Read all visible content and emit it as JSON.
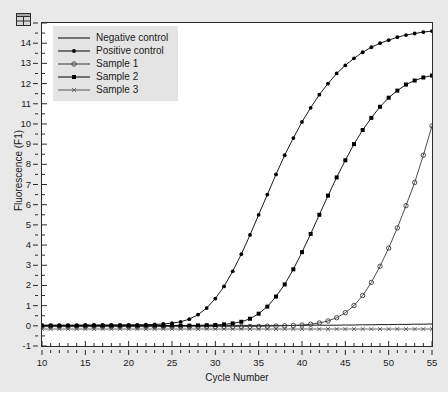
{
  "window": {
    "icon_name": "window-grid-icon"
  },
  "chart_data": {
    "type": "line",
    "title": "",
    "xlabel": "Cycle Number",
    "ylabel": "Fluorescence (F1)",
    "xlim": [
      10,
      55
    ],
    "ylim": [
      -1,
      15
    ],
    "x_major_step": 5,
    "x_minor_step": 1,
    "y_major_step": 1,
    "y_minor_step": 0.5,
    "grid": false,
    "legend_position": "top-left",
    "x_tick_labels": [
      "10",
      "15",
      "20",
      "25",
      "30",
      "35",
      "40",
      "45",
      "50",
      "55"
    ],
    "y_tick_labels": [
      "-1",
      "0",
      "1",
      "2",
      "3",
      "4",
      "5",
      "6",
      "7",
      "8",
      "9",
      "10",
      "11",
      "12",
      "13",
      "14",
      "15"
    ],
    "x": [
      10,
      11,
      12,
      13,
      14,
      15,
      16,
      17,
      18,
      19,
      20,
      21,
      22,
      23,
      24,
      25,
      26,
      27,
      28,
      29,
      30,
      31,
      32,
      33,
      34,
      35,
      36,
      37,
      38,
      39,
      40,
      41,
      42,
      43,
      44,
      45,
      46,
      47,
      48,
      49,
      50,
      51,
      52,
      53,
      54,
      55
    ],
    "series": [
      {
        "name": "Negative control",
        "marker": "none",
        "color": "#000000",
        "values": [
          0.02,
          0.02,
          0.02,
          0.02,
          0.02,
          0.02,
          0.02,
          0.02,
          0.02,
          0.02,
          0.02,
          0.02,
          0.02,
          0.02,
          0.02,
          0.02,
          0.02,
          0.02,
          0.02,
          0.02,
          0.02,
          0.02,
          0.02,
          0.02,
          0.02,
          0.02,
          0.02,
          0.02,
          0.02,
          0.02,
          0.02,
          0.03,
          0.03,
          0.03,
          0.03,
          0.04,
          0.04,
          0.05,
          0.05,
          0.06,
          0.06,
          0.07,
          0.07,
          0.08,
          0.08,
          0.09
        ]
      },
      {
        "name": "Positive control",
        "marker": "dot",
        "color": "#000000",
        "values": [
          0.03,
          0.03,
          0.03,
          0.03,
          0.03,
          0.04,
          0.04,
          0.04,
          0.04,
          0.05,
          0.05,
          0.05,
          0.06,
          0.07,
          0.09,
          0.13,
          0.2,
          0.33,
          0.55,
          0.88,
          1.35,
          1.95,
          2.7,
          3.55,
          4.5,
          5.5,
          6.5,
          7.5,
          8.45,
          9.3,
          10.1,
          10.8,
          11.45,
          12.0,
          12.5,
          12.9,
          13.25,
          13.55,
          13.8,
          14.0,
          14.15,
          14.3,
          14.4,
          14.48,
          14.55,
          14.6
        ]
      },
      {
        "name": "Sample 1",
        "marker": "circle",
        "color": "#3a3a3a",
        "values": [
          -0.04,
          -0.04,
          -0.04,
          -0.04,
          -0.04,
          -0.04,
          -0.04,
          -0.04,
          -0.04,
          -0.04,
          -0.04,
          -0.04,
          -0.04,
          -0.04,
          -0.04,
          -0.04,
          -0.04,
          -0.04,
          -0.04,
          -0.04,
          -0.04,
          -0.04,
          -0.04,
          -0.04,
          -0.03,
          -0.03,
          -0.02,
          -0.01,
          0.0,
          0.02,
          0.04,
          0.08,
          0.14,
          0.24,
          0.4,
          0.65,
          1.0,
          1.5,
          2.15,
          2.95,
          3.85,
          4.85,
          5.95,
          7.1,
          8.45,
          9.9
        ]
      },
      {
        "name": "Sample 2",
        "marker": "square",
        "color": "#000000",
        "values": [
          0.0,
          0.0,
          0.0,
          0.0,
          0.0,
          0.0,
          0.0,
          0.0,
          0.0,
          0.0,
          0.0,
          0.0,
          0.0,
          0.0,
          0.0,
          0.01,
          0.01,
          0.01,
          0.02,
          0.03,
          0.04,
          0.07,
          0.12,
          0.2,
          0.35,
          0.6,
          0.95,
          1.45,
          2.05,
          2.8,
          3.65,
          4.55,
          5.5,
          6.45,
          7.35,
          8.2,
          9.0,
          9.7,
          10.3,
          10.85,
          11.3,
          11.65,
          11.95,
          12.15,
          12.3,
          12.4
        ]
      },
      {
        "name": "Sample 3",
        "marker": "x",
        "color": "#555555",
        "values": [
          -0.16,
          -0.16,
          -0.16,
          -0.16,
          -0.16,
          -0.16,
          -0.16,
          -0.16,
          -0.16,
          -0.16,
          -0.16,
          -0.16,
          -0.16,
          -0.16,
          -0.16,
          -0.16,
          -0.16,
          -0.16,
          -0.16,
          -0.16,
          -0.16,
          -0.16,
          -0.16,
          -0.16,
          -0.16,
          -0.16,
          -0.16,
          -0.16,
          -0.16,
          -0.16,
          -0.16,
          -0.16,
          -0.16,
          -0.16,
          -0.16,
          -0.16,
          -0.16,
          -0.16,
          -0.16,
          -0.16,
          -0.16,
          -0.16,
          -0.16,
          -0.16,
          -0.16,
          -0.16
        ]
      }
    ]
  },
  "legend": {
    "items": [
      {
        "label": "Negative control",
        "marker": "none"
      },
      {
        "label": "Positive control",
        "marker": "dot"
      },
      {
        "label": "Sample 1",
        "marker": "circle"
      },
      {
        "label": "Sample 2",
        "marker": "square"
      },
      {
        "label": "Sample 3",
        "marker": "x"
      }
    ]
  }
}
